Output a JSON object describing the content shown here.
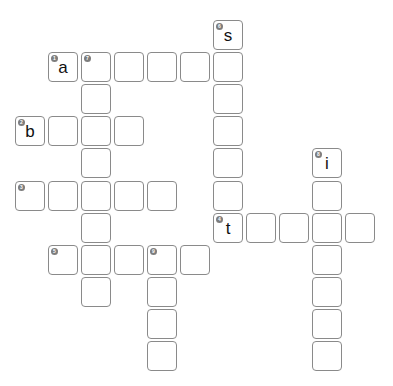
{
  "puzzle": {
    "type": "crossword",
    "grid": {
      "origin_x": 15,
      "origin_y": 20,
      "pitch_x": 33,
      "pitch_y": 32.1
    },
    "cells": [
      {
        "row": 0,
        "col": 6,
        "number": "6",
        "letter": "s"
      },
      {
        "row": 1,
        "col": 1,
        "number": "1",
        "letter": "a"
      },
      {
        "row": 1,
        "col": 2,
        "number": "7",
        "letter": ""
      },
      {
        "row": 1,
        "col": 3,
        "number": "",
        "letter": ""
      },
      {
        "row": 1,
        "col": 4,
        "number": "",
        "letter": ""
      },
      {
        "row": 1,
        "col": 5,
        "number": "",
        "letter": ""
      },
      {
        "row": 1,
        "col": 6,
        "number": "",
        "letter": ""
      },
      {
        "row": 2,
        "col": 2,
        "number": "",
        "letter": ""
      },
      {
        "row": 2,
        "col": 6,
        "number": "",
        "letter": ""
      },
      {
        "row": 3,
        "col": 0,
        "number": "2",
        "letter": "b"
      },
      {
        "row": 3,
        "col": 1,
        "number": "",
        "letter": ""
      },
      {
        "row": 3,
        "col": 2,
        "number": "",
        "letter": ""
      },
      {
        "row": 3,
        "col": 3,
        "number": "",
        "letter": ""
      },
      {
        "row": 3,
        "col": 6,
        "number": "",
        "letter": ""
      },
      {
        "row": 4,
        "col": 2,
        "number": "",
        "letter": ""
      },
      {
        "row": 4,
        "col": 6,
        "number": "",
        "letter": ""
      },
      {
        "row": 4,
        "col": 9,
        "number": "8",
        "letter": "i"
      },
      {
        "row": 5,
        "col": 0,
        "number": "3",
        "letter": ""
      },
      {
        "row": 5,
        "col": 1,
        "number": "",
        "letter": ""
      },
      {
        "row": 5,
        "col": 2,
        "number": "",
        "letter": ""
      },
      {
        "row": 5,
        "col": 3,
        "number": "",
        "letter": ""
      },
      {
        "row": 5,
        "col": 4,
        "number": "",
        "letter": ""
      },
      {
        "row": 5,
        "col": 6,
        "number": "",
        "letter": ""
      },
      {
        "row": 5,
        "col": 9,
        "number": "",
        "letter": ""
      },
      {
        "row": 6,
        "col": 2,
        "number": "",
        "letter": ""
      },
      {
        "row": 6,
        "col": 6,
        "number": "4",
        "letter": "t"
      },
      {
        "row": 6,
        "col": 7,
        "number": "",
        "letter": ""
      },
      {
        "row": 6,
        "col": 8,
        "number": "",
        "letter": ""
      },
      {
        "row": 6,
        "col": 9,
        "number": "",
        "letter": ""
      },
      {
        "row": 6,
        "col": 10,
        "number": "",
        "letter": ""
      },
      {
        "row": 7,
        "col": 1,
        "number": "5",
        "letter": ""
      },
      {
        "row": 7,
        "col": 2,
        "number": "",
        "letter": ""
      },
      {
        "row": 7,
        "col": 3,
        "number": "",
        "letter": ""
      },
      {
        "row": 7,
        "col": 4,
        "number": "9",
        "letter": ""
      },
      {
        "row": 7,
        "col": 5,
        "number": "",
        "letter": ""
      },
      {
        "row": 7,
        "col": 9,
        "number": "",
        "letter": ""
      },
      {
        "row": 8,
        "col": 2,
        "number": "",
        "letter": ""
      },
      {
        "row": 8,
        "col": 4,
        "number": "",
        "letter": ""
      },
      {
        "row": 8,
        "col": 9,
        "number": "",
        "letter": ""
      },
      {
        "row": 9,
        "col": 4,
        "number": "",
        "letter": ""
      },
      {
        "row": 9,
        "col": 9,
        "number": "",
        "letter": ""
      },
      {
        "row": 10,
        "col": 4,
        "number": "",
        "letter": ""
      },
      {
        "row": 10,
        "col": 9,
        "number": "",
        "letter": ""
      }
    ]
  },
  "colors": {
    "cell_border": "#8a8a8a",
    "number_badge": "#7d7d7d",
    "letter": "#111111",
    "background": "#ffffff"
  }
}
